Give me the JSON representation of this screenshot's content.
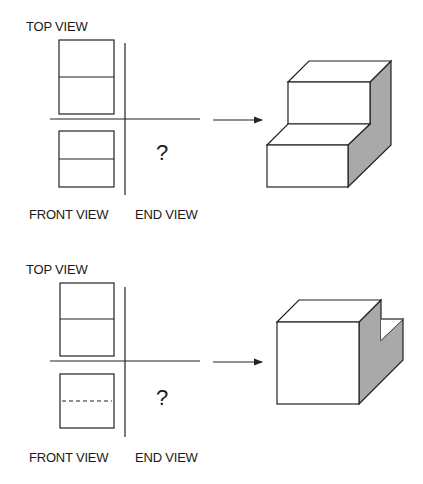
{
  "problems": [
    {
      "top_view_label": "TOP VIEW",
      "front_view_label": "FRONT VIEW",
      "end_view_label": "END VIEW",
      "unknown_mark": "?",
      "front_view_hidden_line": false,
      "object": "stepped block"
    },
    {
      "top_view_label": "TOP VIEW",
      "front_view_label": "FRONT VIEW",
      "end_view_label": "END VIEW",
      "unknown_mark": "?",
      "front_view_hidden_line": true,
      "object": "notched cube"
    }
  ],
  "colors": {
    "line": "#222222",
    "shade": "#a9a9a9",
    "background": "#ffffff"
  }
}
